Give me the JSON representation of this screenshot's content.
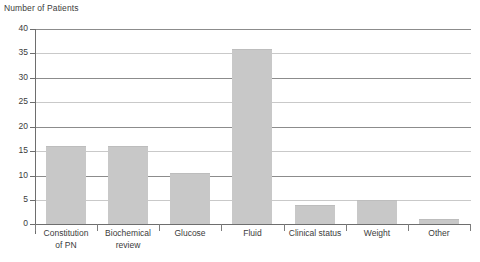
{
  "chart_data": {
    "type": "bar",
    "title": "Number of Patients",
    "xlabel": "",
    "ylabel": "Number of Patients",
    "ylim": [
      0,
      40
    ],
    "ytick_step": 5,
    "yticks": [
      "40",
      "35",
      "30",
      "25",
      "20",
      "15",
      "10",
      "5",
      "0"
    ],
    "grid": true,
    "legend": "none",
    "categories": [
      "Constitution\nof PN",
      "Biochemical\nreview",
      "Glucose",
      "Fluid",
      "Clinical status",
      "Weight",
      "Other"
    ],
    "category_lines": [
      [
        "Constitution",
        "of PN"
      ],
      [
        "Biochemical",
        "review"
      ],
      [
        "Glucose"
      ],
      [
        "Fluid"
      ],
      [
        "Clinical status"
      ],
      [
        "Weight"
      ],
      [
        "Other"
      ]
    ],
    "values": [
      16,
      16,
      10.5,
      36,
      4,
      5,
      1
    ],
    "bar_color": "#c8c8c8",
    "gridline_color": "#8c8c8c",
    "axis_color": "#6e6e6e",
    "text_color": "#3b3b3b",
    "background": "#ffffff"
  }
}
